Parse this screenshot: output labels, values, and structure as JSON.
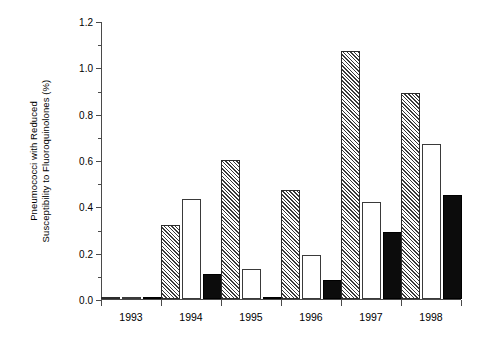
{
  "chart_data": {
    "type": "bar",
    "title": "",
    "subtitle": "",
    "xlabel": "",
    "ylabel": "Pneumococci with Reduced Susceptibility to Fluoroquinolones (%)",
    "ylabel_line1": "Pneumococci with Reduced",
    "ylabel_line2": "Susceptibility to Fluoroquinolones (%)",
    "categories": [
      "1993",
      "1994",
      "1995",
      "1996",
      "1997",
      "1998"
    ],
    "series": [
      {
        "name": "series-1-hatched",
        "pattern": "hatched",
        "color": "#3a3a3a",
        "values": [
          0.01,
          0.32,
          0.6,
          0.47,
          1.07,
          0.89
        ]
      },
      {
        "name": "series-2-open",
        "pattern": "open",
        "color": "#ffffff",
        "values": [
          0.01,
          0.43,
          0.13,
          0.19,
          0.42,
          0.67
        ]
      },
      {
        "name": "series-3-solid",
        "pattern": "solid",
        "color": "#0c0c0c",
        "values": [
          0.01,
          0.11,
          0.01,
          0.08,
          0.29,
          0.45
        ]
      }
    ],
    "ylim": [
      0.0,
      1.2
    ],
    "ytick_labels": [
      "0.0",
      "0.2",
      "0.4",
      "0.6",
      "0.8",
      "1.0",
      "1.2"
    ],
    "ytick_values": [
      0.0,
      0.2,
      0.4,
      0.6,
      0.8,
      1.0,
      1.2
    ],
    "yminor_values": [
      0.1,
      0.3,
      0.5,
      0.7,
      0.9,
      1.1
    ],
    "grid": false,
    "legend": "none",
    "legend_position": "none",
    "annotations": []
  }
}
